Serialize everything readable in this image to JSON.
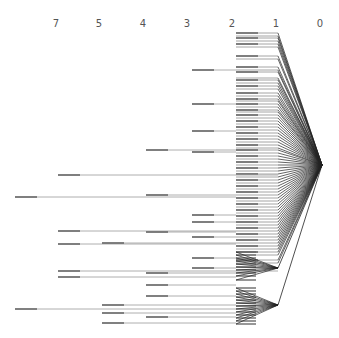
{
  "diagram": {
    "type": "tree-depth-dendrogram",
    "colors": {
      "edge": "#222222",
      "branch": "#9a9a9a",
      "branch_dark": "#6a6a6a"
    },
    "axis": {
      "labels": [
        {
          "text": "7",
          "x": 56
        },
        {
          "text": "5",
          "x": 99
        },
        {
          "text": "4",
          "x": 143
        },
        {
          "text": "3",
          "x": 187
        },
        {
          "text": "2",
          "x": 232
        },
        {
          "text": "1",
          "x": 276
        },
        {
          "text": "0",
          "x": 320
        }
      ]
    },
    "root": {
      "x": 322,
      "y": 165
    },
    "hubs": [
      {
        "x": 278,
        "y": 268
      },
      {
        "x": 278,
        "y": 305
      }
    ],
    "level_x": {
      "0": 322,
      "1": 278,
      "2": 236,
      "3": 192,
      "4": 146,
      "5": 102,
      "7": 15
    },
    "root_leaves_y": [
      33,
      36,
      38,
      41,
      44,
      47,
      56,
      59,
      67,
      70,
      72,
      78,
      80,
      83,
      86,
      89,
      93,
      96,
      99,
      101,
      104,
      107,
      110,
      112,
      115,
      118,
      121,
      124,
      127,
      130,
      133,
      136,
      139,
      142,
      145,
      148,
      150,
      153,
      156,
      159,
      162,
      165,
      168,
      171,
      174,
      177,
      180,
      183,
      186,
      189,
      192,
      195,
      198,
      201,
      204,
      207,
      210,
      213,
      216,
      219,
      222,
      225,
      228,
      231,
      234,
      237,
      240,
      243,
      246,
      249,
      252,
      255,
      260,
      263
    ],
    "hub_edges": [
      {
        "hub": 0,
        "ys": [
          252,
          255,
          258,
          261,
          264,
          267,
          270,
          273,
          276,
          280
        ]
      },
      {
        "hub": 1,
        "ys": [
          288,
          291,
          294,
          297,
          300,
          303,
          306,
          309,
          312,
          315,
          318,
          321,
          324
        ]
      }
    ],
    "long_branches": [
      {
        "y": 150,
        "from": 146,
        "to": 236
      },
      {
        "y": 175,
        "from": 58,
        "to": 278
      },
      {
        "y": 197,
        "from": 15,
        "to": 236
      },
      {
        "y": 231,
        "from": 58,
        "to": 236
      },
      {
        "y": 244,
        "from": 58,
        "to": 236
      },
      {
        "y": 271,
        "from": 58,
        "to": 278
      },
      {
        "y": 277,
        "from": 58,
        "to": 236
      },
      {
        "y": 309,
        "from": 15,
        "to": 236
      },
      {
        "y": 70,
        "from": 192,
        "to": 236
      },
      {
        "y": 195,
        "from": 146,
        "to": 236
      },
      {
        "y": 232,
        "from": 146,
        "to": 236
      },
      {
        "y": 243,
        "from": 102,
        "to": 236
      },
      {
        "y": 273,
        "from": 146,
        "to": 236
      },
      {
        "y": 285,
        "from": 146,
        "to": 236
      },
      {
        "y": 296,
        "from": 146,
        "to": 236
      },
      {
        "y": 305,
        "from": 102,
        "to": 236
      },
      {
        "y": 313,
        "from": 102,
        "to": 236
      },
      {
        "y": 317,
        "from": 146,
        "to": 236
      },
      {
        "y": 323,
        "from": 102,
        "to": 236
      },
      {
        "y": 104,
        "from": 192,
        "to": 236
      },
      {
        "y": 131,
        "from": 192,
        "to": 236
      },
      {
        "y": 152,
        "from": 192,
        "to": 236
      },
      {
        "y": 215,
        "from": 192,
        "to": 236
      },
      {
        "y": 222,
        "from": 192,
        "to": 236
      },
      {
        "y": 237,
        "from": 192,
        "to": 236
      },
      {
        "y": 258,
        "from": 192,
        "to": 236
      },
      {
        "y": 268,
        "from": 192,
        "to": 236
      }
    ]
  }
}
